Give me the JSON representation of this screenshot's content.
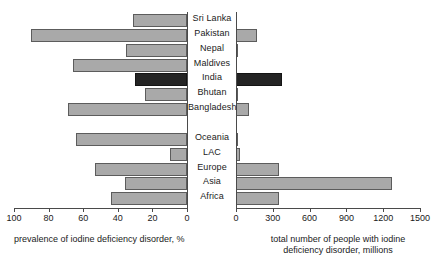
{
  "chart_data": {
    "type": "bar",
    "title": "",
    "orientation": "horizontal",
    "layout": "back-to-back paired panels",
    "grid": false,
    "legend": null,
    "categories": [
      "Sri Lanka",
      "Pakistan",
      "Nepal",
      "Maldives",
      "India",
      "Bhutan",
      "Bangladesh",
      "",
      "Oceania",
      "LAC",
      "Europe",
      "Asia",
      "Africa"
    ],
    "highlight_category": "India",
    "colors": {
      "bar_fill": "#a9a9a9",
      "bar_stroke": "#5c5c5c",
      "highlight_fill": "#242424",
      "highlight_stroke": "#141414",
      "axis": "#4a4a4a",
      "text": "#1a1a1a"
    },
    "panels": [
      {
        "id": "left",
        "xlabel": "prevalence of iodine deficiency disorder, %",
        "xlim": [
          100,
          0
        ],
        "direction": "right-to-left",
        "ticks": [
          100,
          80,
          60,
          40,
          20,
          0
        ],
        "ticklabels": [
          "100",
          "80",
          "60",
          "40",
          "20",
          "0"
        ],
        "values": [
          31,
          90,
          35,
          66,
          30,
          24,
          69,
          null,
          64,
          10,
          53,
          36,
          44
        ]
      },
      {
        "id": "right",
        "xlabel": "total number of people with iodine deficiency disorder, millions",
        "xlabel_line1": "total number of people with iodine",
        "xlabel_line2": "deficiency disorder, millions",
        "xlim": [
          0,
          1500
        ],
        "direction": "left-to-right",
        "ticks": [
          0,
          300,
          600,
          900,
          1200,
          1500
        ],
        "ticklabels": [
          "0",
          "300",
          "600",
          "900",
          "1200",
          "1500"
        ],
        "values": [
          0,
          170,
          12,
          0,
          375,
          2,
          105,
          null,
          15,
          35,
          350,
          1270,
          350
        ]
      }
    ]
  },
  "source_note": ""
}
